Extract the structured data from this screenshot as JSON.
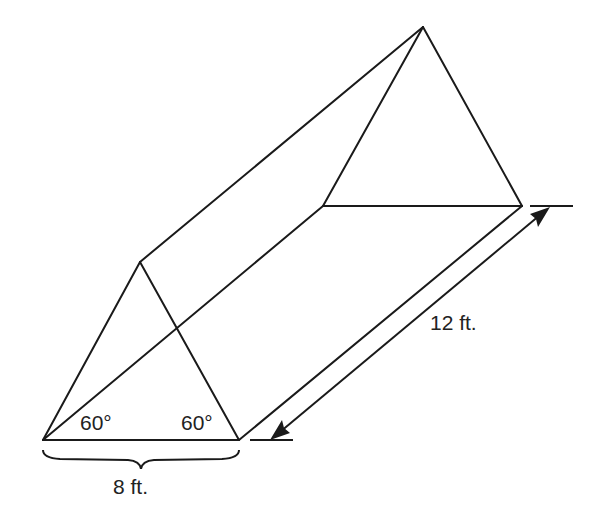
{
  "figure": {
    "type": "triangular-prism",
    "labels": {
      "angle_left": "60°",
      "angle_right": "60°",
      "base_width": "8 ft.",
      "length": "12 ft."
    },
    "vertices": {
      "front_left": [
        43,
        440
      ],
      "front_right": [
        239,
        440
      ],
      "front_apex": [
        140,
        262
      ],
      "back_left": [
        323,
        206
      ],
      "back_right": [
        522,
        206
      ],
      "back_apex": [
        423,
        27
      ]
    },
    "colors": {
      "stroke": "#1a1a1a",
      "text": "#222222",
      "background": "#ffffff"
    }
  }
}
